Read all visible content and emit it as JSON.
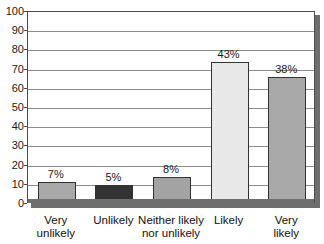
{
  "chart_data": {
    "type": "bar",
    "title": "",
    "subtitle": "",
    "xlabel": "",
    "ylabel": "",
    "ylim": [
      0,
      100
    ],
    "ytick_step": 10,
    "yticks": [
      "100",
      "90",
      "80",
      "70",
      "60",
      "50",
      "40",
      "30",
      "20",
      "10",
      "0"
    ],
    "grid": true,
    "legend": false,
    "legend_position": "none",
    "categories": [
      "Very\nunlikely",
      "Unlikely",
      "Neither likely\nnor unlikely",
      "Likely",
      "Very likely"
    ],
    "category_labels_flat": [
      "Very unlikely",
      "Unlikely",
      "Neither likely nor unlikely",
      "Likely",
      "Very likely"
    ],
    "values": [
      10.5,
      9,
      13,
      73,
      65
    ],
    "data_labels": [
      "7%",
      "5%",
      "8%",
      "43%",
      "38%"
    ],
    "bar_colors": [
      "#a8a8a8",
      "#333333",
      "#a3a3a3",
      "#e8e8e8",
      "#a8a8a8"
    ],
    "bar_border_color": "#333333",
    "gridline_color": "#8c8c8c",
    "axis_color": "#4d4d4d",
    "shadow_color": "#6e6e6e",
    "text_color": "#1a1a1a",
    "background_color": "#ffffff"
  }
}
